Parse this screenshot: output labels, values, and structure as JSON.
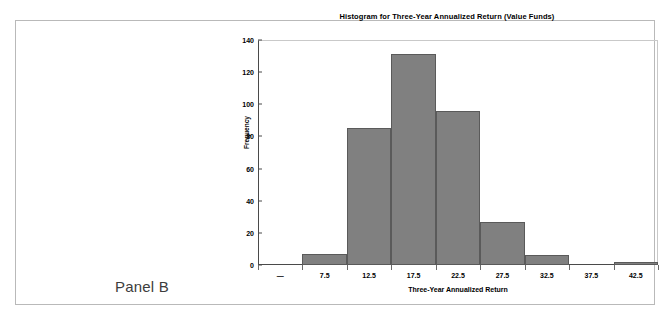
{
  "panel": {
    "label": "Panel B"
  },
  "chart_data": {
    "type": "bar",
    "title": "Histogram for Three-Year Annualized Return (Value Funds)",
    "xlabel": "Three-Year Annualized Return",
    "ylabel": "Frequency",
    "categories": [
      "—",
      "7.5",
      "12.5",
      "17.5",
      "22.5",
      "27.5",
      "32.5",
      "37.5",
      "42.5"
    ],
    "bin_centers": [
      2.5,
      7.5,
      12.5,
      17.5,
      22.5,
      27.5,
      32.5,
      37.5,
      42.5
    ],
    "values": [
      0,
      7,
      85,
      131,
      96,
      27,
      6,
      0,
      2
    ],
    "ylim": [
      0,
      140
    ],
    "yticks": [
      0,
      20,
      40,
      60,
      80,
      100,
      120,
      140
    ],
    "ytick_labels": [
      "0",
      "20",
      "40",
      "60",
      "80",
      "100",
      "120",
      "140"
    ],
    "xtick_labels": [
      "—",
      "7.5",
      "12.5",
      "17.5",
      "22.5",
      "27.5",
      "32.5",
      "37.5",
      "42.5"
    ],
    "grid": false,
    "legend": null,
    "bar_color": "#808080",
    "bar_edge_color": "#5a5a5a",
    "axis_color": "#4a4a4a"
  }
}
